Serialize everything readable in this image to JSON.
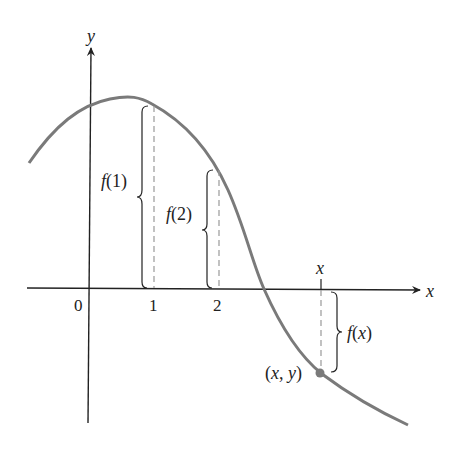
{
  "figure": {
    "axes": {
      "x_label": "x",
      "y_label": "y",
      "origin_label": "0",
      "ticks": [
        {
          "label": "1"
        },
        {
          "label": "2"
        }
      ],
      "top_x_label": "x"
    },
    "annotations": {
      "f1": "f(1)",
      "f2": "f(2)",
      "fx": "f(x)",
      "point": "(x, y)"
    },
    "colors": {
      "curve": "#7a7a7a",
      "axis": "#222222",
      "dashed": "#999999",
      "point": "#7a7a7a"
    }
  }
}
